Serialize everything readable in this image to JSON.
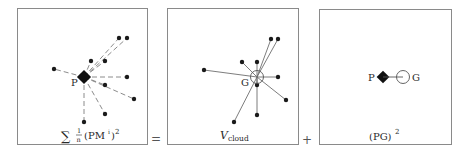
{
  "panels": [
    {
      "id": "left",
      "caption_sum": "∑",
      "caption_frac_num": "1",
      "caption_frac_den": "n",
      "caption_rest": "(PM",
      "caption_sup_i": "i",
      "caption_close": ")",
      "caption_sup_2": "2",
      "point_label": "P",
      "center": [
        84,
        77
      ],
      "points": [
        [
          119,
          38
        ],
        [
          127,
          38
        ],
        [
          91,
          61
        ],
        [
          105,
          61
        ],
        [
          54,
          69
        ],
        [
          127,
          77
        ],
        [
          105,
          85
        ],
        [
          134,
          99
        ],
        [
          105,
          114
        ],
        [
          84,
          122
        ]
      ],
      "edge_style": "dashed"
    },
    {
      "id": "middle",
      "caption_main": "V",
      "caption_sub": "cloud",
      "point_label": "G",
      "center": [
        257,
        77
      ],
      "points": [
        [
          271,
          39
        ],
        [
          278,
          39
        ],
        [
          242,
          62
        ],
        [
          257,
          62
        ],
        [
          204,
          70
        ],
        [
          278,
          77
        ],
        [
          257,
          85
        ],
        [
          286,
          100
        ],
        [
          257,
          115
        ],
        [
          234,
          122
        ]
      ],
      "edge_style": "solid"
    },
    {
      "id": "right",
      "caption_main": "(PG)",
      "caption_sup": "2",
      "label_p": "P",
      "label_g": "G",
      "p": [
        383,
        77
      ],
      "g": [
        403,
        77
      ]
    }
  ],
  "operators": {
    "equals": "=",
    "plus": "+"
  }
}
